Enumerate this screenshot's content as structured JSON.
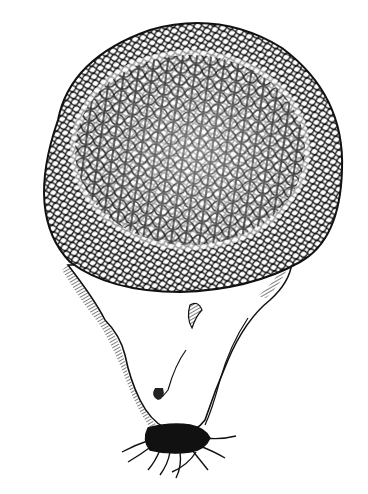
{
  "image": {
    "subject": "pen-and-ink illustration of a puffball mushroom",
    "style": "black ink line drawing on white",
    "colors": {
      "background": "#ffffff",
      "ink": "#111111"
    },
    "parts": [
      {
        "name": "cap",
        "description": "large rounded cap covered with reticulate net-like polygonal pattern"
      },
      {
        "name": "stem",
        "description": "tapered white stem with hatched shading on sides"
      },
      {
        "name": "roots",
        "description": "dark mycelial root cluster at base"
      }
    ]
  }
}
